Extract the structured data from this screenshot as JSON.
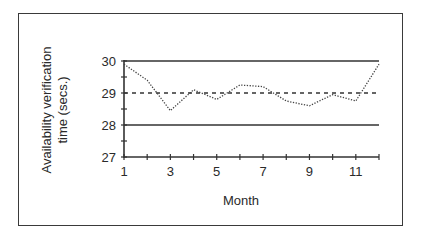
{
  "chart_data": {
    "type": "line",
    "title": "",
    "xlabel": "Month",
    "ylabel": "Availability verification time (secs.)",
    "ylabel_lines": [
      "Availability verification",
      "time (secs.)"
    ],
    "x": [
      1,
      2,
      3,
      4,
      5,
      6,
      7,
      8,
      9,
      10,
      11,
      12
    ],
    "x_tick_labels": [
      "1",
      "3",
      "5",
      "7",
      "9",
      "11"
    ],
    "y_tick_labels": [
      "27",
      "28",
      "29",
      "30"
    ],
    "ylim": [
      27,
      30
    ],
    "xlim": [
      1,
      12
    ],
    "grid": false,
    "legend": null,
    "series": [
      {
        "name": "Availability verification time",
        "style": "dotted",
        "values": [
          29.9,
          29.4,
          28.45,
          29.1,
          28.8,
          29.25,
          29.2,
          28.75,
          28.6,
          28.95,
          28.75,
          29.9
        ]
      }
    ],
    "reference_lines": [
      {
        "name": "Upper control limit",
        "y": 30,
        "style": "solid"
      },
      {
        "name": "Center line (mean)",
        "y": 29,
        "style": "dashed"
      },
      {
        "name": "Lower control limit",
        "y": 28,
        "style": "solid"
      }
    ]
  }
}
